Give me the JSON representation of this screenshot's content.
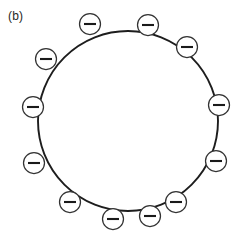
{
  "figure": {
    "panel_label": "(b)",
    "colors": {
      "background": "#ffffff",
      "outline": "#1d1d1d",
      "chain": "#444444",
      "charge_stroke": "#333333",
      "charge_bar": "#1a1a1a",
      "label_text": "#262626"
    },
    "particle": {
      "name": "particle-outline",
      "shape": "circle",
      "center_x": 128,
      "center_y": 121,
      "radius": 90
    },
    "charges": {
      "symbol": "minus",
      "count": 12,
      "disc_radius": 10.5,
      "bar_half_width": 6.0,
      "items": [
        {
          "label": "minus-charge-1",
          "x": 90,
          "y": 24
        },
        {
          "label": "minus-charge-2",
          "x": 148,
          "y": 25
        },
        {
          "label": "minus-charge-3",
          "x": 46,
          "y": 59
        },
        {
          "label": "minus-charge-4",
          "x": 187,
          "y": 47
        },
        {
          "label": "minus-charge-5",
          "x": 33,
          "y": 107
        },
        {
          "label": "minus-charge-6",
          "x": 219,
          "y": 105
        },
        {
          "label": "minus-charge-7",
          "x": 34,
          "y": 163
        },
        {
          "label": "minus-charge-8",
          "x": 216,
          "y": 161
        },
        {
          "label": "minus-charge-9",
          "x": 70,
          "y": 202
        },
        {
          "label": "minus-charge-10",
          "x": 176,
          "y": 202
        },
        {
          "label": "minus-charge-11",
          "x": 113,
          "y": 219
        },
        {
          "label": "minus-charge-12",
          "x": 150,
          "y": 216
        }
      ]
    },
    "chains": {
      "name": "polymer-chains",
      "count": 8,
      "paths": [
        "M 57 72 L 70 63 L 71 78 L 86 70 L 88 85 L 101 78 L 103 94 L 117 86 L 118 101 L 132 93 L 133 108 L 146 100 L 148 114",
        "M 74 47 L 84 60 L 96 50 L 103 64 L 116 55 L 122 70 L 134 62 L 140 77 L 152 69 L 156 84",
        "M 131 42 L 139 55 L 128 64 L 136 77 L 126 86 L 134 99 L 124 108 L 131 120",
        "M 153 40 L 163 52 L 155 64 L 167 74 L 159 86 L 171 96 L 164 108 L 177 117",
        "M 176 50 L 182 64 L 194 57 L 198 72 L 209 66 L 212 80",
        "M 44 115 L 56 124 L 68 113 L 80 124 L 92 112 L 104 123 L 116 111 L 128 122",
        "M 140 120 L 152 110 L 164 121 L 176 109 L 188 120 L 200 108 L 212 118",
        "M 52 140 L 65 133 L 66 148 L 80 140 L 82 156 L 95 148 L 97 163 L 110 155 L 112 170 L 125 162 L 127 177",
        "M 70 160 L 80 172 L 70 182 L 81 193 L 72 203 L 84 213",
        "M 152 136 L 162 148 L 151 158 L 162 169 L 152 179 L 163 190 L 154 200",
        "M 147 150 L 160 142 L 162 157 L 176 149 L 178 164 L 191 156 L 193 171 L 206 163",
        "M 118 152 L 130 162 L 120 172 L 132 182 L 122 192 L 134 202 L 124 212 L 135 221",
        "M 184 135 L 196 128 L 198 143 L 210 136",
        "M 104 45 L 112 58 L 101 67 L 109 80 L 98 89 L 106 102"
      ]
    }
  }
}
